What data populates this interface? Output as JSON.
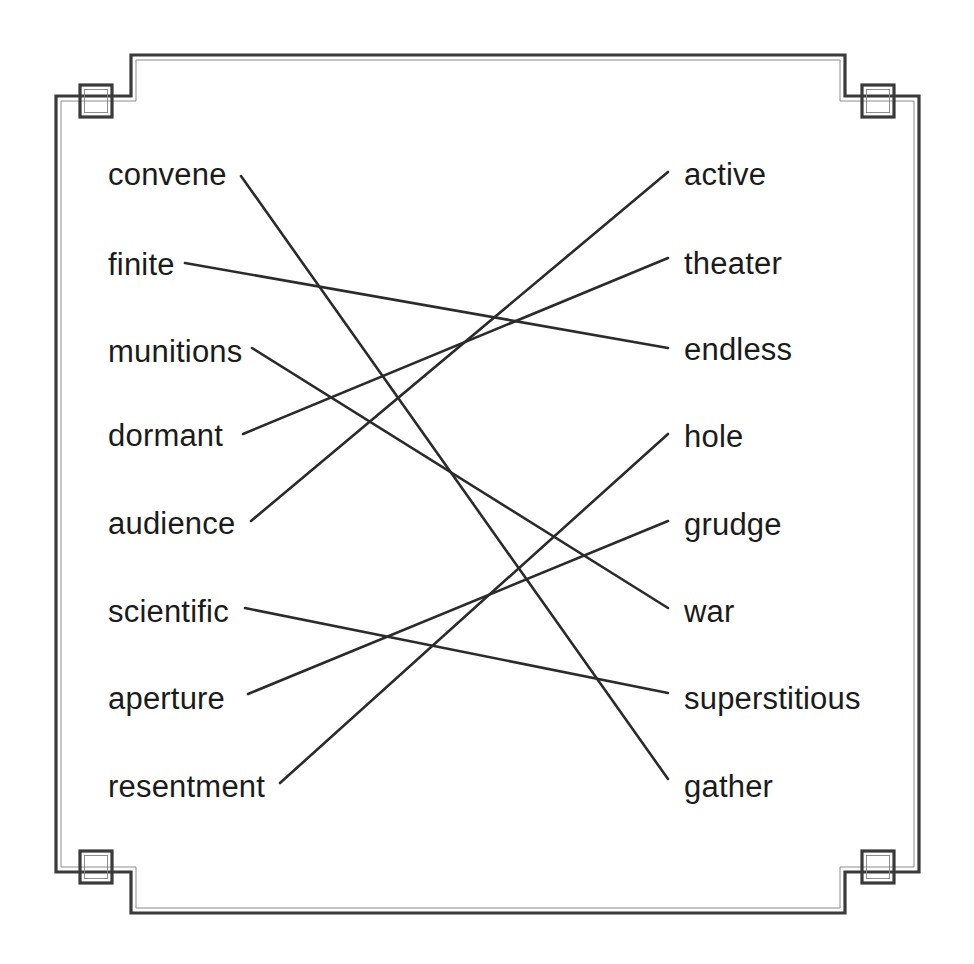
{
  "puzzle": {
    "type": "matching-puzzle",
    "instruction_text": "",
    "frame": {
      "style": "decorative-corner-border",
      "stroke_color": "#3a3a3a",
      "background_color": "#ffffff",
      "corner_icons": [
        "corner-square-top-left",
        "corner-square-top-right",
        "corner-square-bottom-left",
        "corner-square-bottom-right"
      ]
    },
    "line_color": "#2b2b2b",
    "text_color": "#1b1b1b",
    "left_column": [
      {
        "label": "convene",
        "x": 108,
        "y": 175
      },
      {
        "label": "finite",
        "x": 108,
        "y": 265
      },
      {
        "label": "munitions",
        "x": 108,
        "y": 352
      },
      {
        "label": "dormant",
        "x": 108,
        "y": 436
      },
      {
        "label": "audience",
        "x": 108,
        "y": 524
      },
      {
        "label": "scientific",
        "x": 108,
        "y": 612
      },
      {
        "label": "aperture",
        "x": 108,
        "y": 699
      },
      {
        "label": "resentment",
        "x": 108,
        "y": 787
      }
    ],
    "right_column": [
      {
        "label": "active",
        "x": 684,
        "y": 175
      },
      {
        "label": "theater",
        "x": 684,
        "y": 264
      },
      {
        "label": "endless",
        "x": 684,
        "y": 350
      },
      {
        "label": "hole",
        "x": 684,
        "y": 437
      },
      {
        "label": "grudge",
        "x": 684,
        "y": 525
      },
      {
        "label": "war",
        "x": 684,
        "y": 612
      },
      {
        "label": "superstitious",
        "x": 684,
        "y": 699
      },
      {
        "label": "gather",
        "x": 684,
        "y": 787
      }
    ],
    "connections": [
      {
        "from": "convene",
        "to": "gather",
        "x1": 241,
        "y1": 176,
        "x2": 668,
        "y2": 779
      },
      {
        "from": "finite",
        "to": "endless",
        "x1": 185,
        "y1": 263,
        "x2": 668,
        "y2": 348
      },
      {
        "from": "munitions",
        "to": "war",
        "x1": 252,
        "y1": 348,
        "x2": 668,
        "y2": 608
      },
      {
        "from": "dormant",
        "to": "theater",
        "x1": 243,
        "y1": 434,
        "x2": 668,
        "y2": 258
      },
      {
        "from": "audience",
        "to": "active",
        "x1": 251,
        "y1": 521,
        "x2": 668,
        "y2": 172
      },
      {
        "from": "scientific",
        "to": "superstitious",
        "x1": 245,
        "y1": 608,
        "x2": 668,
        "y2": 693
      },
      {
        "from": "aperture",
        "to": "grudge",
        "x1": 248,
        "y1": 694,
        "x2": 668,
        "y2": 521
      },
      {
        "from": "resentment",
        "to": "hole",
        "x1": 280,
        "y1": 783,
        "x2": 668,
        "y2": 434
      }
    ]
  }
}
